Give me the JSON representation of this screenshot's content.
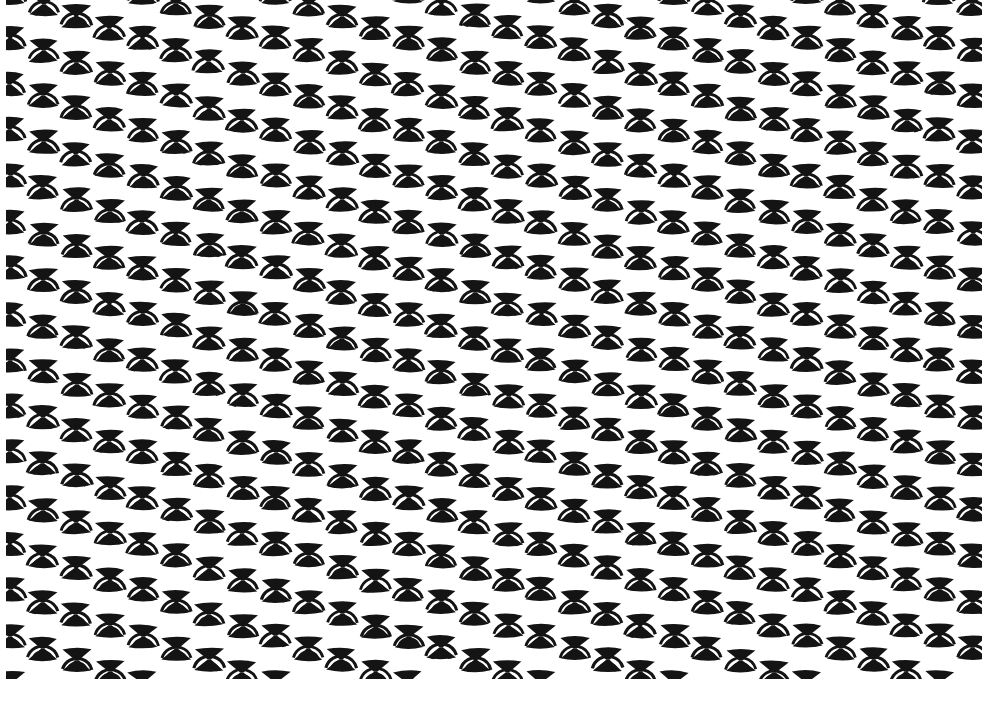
{
  "document": {
    "title": "Geometric Textile Pattern",
    "kind": "seamless-repeating-pattern",
    "width": 992,
    "height": 715
  },
  "colors": {
    "background": "#ffffff",
    "ink": "#141414",
    "ink_soft": "#1c1c1c"
  },
  "pattern": {
    "motif_name": "bowtie-and-fan-arcs",
    "motif_description": "Hourglass bowtie of two apex-joined triangles above a fan of two concentric arcs",
    "columns": 30,
    "rows": 17,
    "column_spacing": 33.2,
    "row_spacing": 46.0,
    "origin_x": 10,
    "origin_y": -8,
    "stagger_cycle": 4,
    "stagger_offsets": [
      0,
      12,
      24,
      36
    ],
    "motif": {
      "bowtie_half_width": 14.5,
      "bowtie_half_height": 10.5,
      "bowtie_waist": 1.6,
      "arc_count": 2,
      "arc_stroke": 3.0,
      "arc_radius_inner": 9.5,
      "arc_radius_outer": 15.5,
      "arc_span_degrees": 150,
      "arc_center_y_offset": 13
    },
    "edge_profile_top": "sawtooth descending over 4 columns",
    "edge_profile_bottom": "sawtooth descending over 4 columns",
    "margins": {
      "left": 10,
      "right": 16,
      "top": 12,
      "bottom": 58
    }
  }
}
